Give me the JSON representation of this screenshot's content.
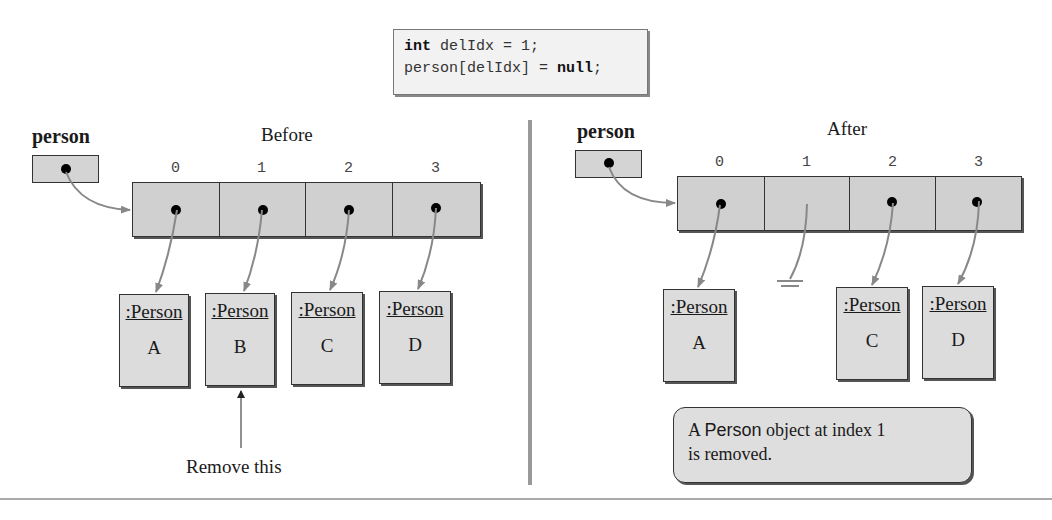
{
  "code": {
    "line1_keyword": "int",
    "line1_rest": " delIdx = 1;",
    "line2_start": "person[delIdx] = ",
    "line2_keyword": "null",
    "line2_end": ";"
  },
  "before": {
    "heading": "Before",
    "var_label": "person",
    "indices": [
      "0",
      "1",
      "2",
      "3"
    ],
    "objects": [
      {
        "class": ":Person",
        "name": "A"
      },
      {
        "class": ":Person",
        "name": "B"
      },
      {
        "class": ":Person",
        "name": "C"
      },
      {
        "class": ":Person",
        "name": "D"
      }
    ],
    "annotation": "Remove this"
  },
  "after": {
    "heading": "After",
    "var_label": "person",
    "indices": [
      "0",
      "1",
      "2",
      "3"
    ],
    "objects": [
      {
        "class": ":Person",
        "name": "A"
      },
      {
        "class": ":Person",
        "name": "C"
      },
      {
        "class": ":Person",
        "name": "D"
      }
    ],
    "note_prefix": "A ",
    "note_code": "Person",
    "note_rest": " object at index 1",
    "note_line2": "is removed."
  },
  "colors": {
    "cell_fill": "#d0d0d0",
    "arrow": "#888888",
    "divider": "#999999"
  }
}
